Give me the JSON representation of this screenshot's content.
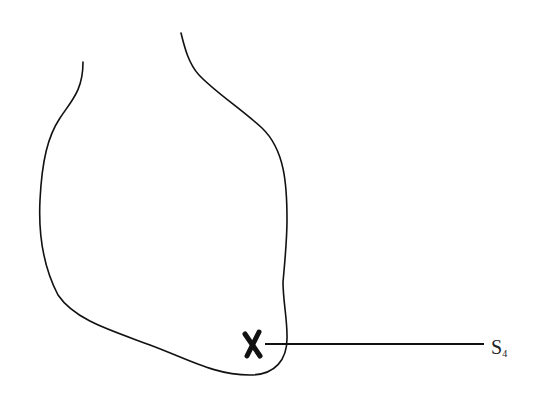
{
  "diagram": {
    "marker": {
      "glyph": "X",
      "position": "apex region, lower right of heart"
    },
    "label": {
      "main": "S",
      "subscript": "4"
    },
    "colors": {
      "line": "#111111",
      "background": "#ffffff"
    }
  }
}
